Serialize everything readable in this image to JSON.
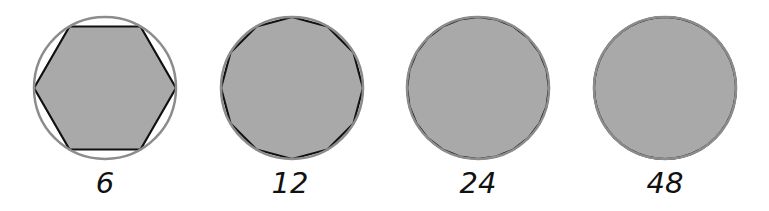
{
  "figure": {
    "fill_color": "#a9a9a9",
    "stroke_color": "#111111",
    "circle_color": "#8c8c8c",
    "items": [
      {
        "sides": 6,
        "label": "6",
        "cx": 105,
        "cy": 88,
        "r": 71
      },
      {
        "sides": 12,
        "label": "12",
        "cx": 292,
        "cy": 88,
        "r": 71
      },
      {
        "sides": 24,
        "label": "24",
        "cx": 478,
        "cy": 88,
        "r": 71
      },
      {
        "sides": 48,
        "label": "48",
        "cx": 665,
        "cy": 88,
        "r": 71
      }
    ]
  }
}
